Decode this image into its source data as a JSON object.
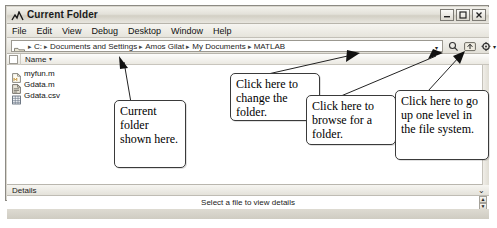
{
  "window": {
    "title": "Current Folder",
    "app_icon": "matlab-membrane-icon",
    "controls": [
      {
        "name": "minimize",
        "glyph": "–"
      },
      {
        "name": "maximize",
        "glyph": "▭"
      },
      {
        "name": "close",
        "glyph": "✕"
      }
    ]
  },
  "menubar": {
    "items": [
      {
        "label": "File",
        "mnemonic": "F"
      },
      {
        "label": "Edit",
        "mnemonic": "E"
      },
      {
        "label": "View",
        "mnemonic": "V"
      },
      {
        "label": "Debug",
        "mnemonic": "g"
      },
      {
        "label": "Desktop",
        "mnemonic": "D"
      },
      {
        "label": "Window",
        "mnemonic": "W"
      },
      {
        "label": "Help",
        "mnemonic": "H"
      }
    ]
  },
  "address_bar": {
    "folder_icon": "folder-icon",
    "separator": "▸",
    "crumbs": [
      "C:",
      "Documents and Settings",
      "Amos Gilat",
      "My Documents",
      "MATLAB"
    ],
    "dropdown_glyph": "▾",
    "buttons": [
      {
        "name": "search-browse-button",
        "icon": "magnifier-icon"
      },
      {
        "name": "go-up-one-level-button",
        "icon": "folder-up-arrow-icon"
      },
      {
        "name": "actions-button",
        "icon": "gear-icon",
        "dropdown_glyph": "▾"
      }
    ]
  },
  "file_list": {
    "column_header": {
      "label": "Name",
      "sort_glyph": "▾"
    },
    "files": [
      {
        "name": "myfun.m",
        "icon": "m-file-icon"
      },
      {
        "name": "Gdata.m",
        "icon": "m-file-icon"
      },
      {
        "name": "Gdata.csv",
        "icon": "csv-file-icon"
      }
    ]
  },
  "details_panel": {
    "header_label": "Details",
    "collapse_glyph": "⌄",
    "body_text": "Select a file to view details",
    "scroll_up_glyph": "▲",
    "scroll_down_glyph": "▼"
  },
  "annotations": [
    {
      "id": "current-folder-callout",
      "text": "Current folder shown here."
    },
    {
      "id": "change-folder-callout",
      "text": "Click here to change the folder."
    },
    {
      "id": "browse-folder-callout",
      "text": "Click here to browse for a folder."
    },
    {
      "id": "go-up-level-callout",
      "text": "Click here to go up one level in the file system."
    }
  ]
}
